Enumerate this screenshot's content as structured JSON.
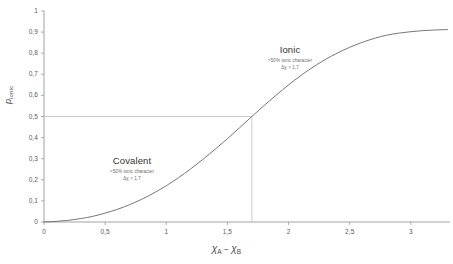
{
  "chart_data": {
    "type": "line",
    "title": "",
    "subtitle": "",
    "xlabel": "χA − χB",
    "ylabel": "pionic",
    "xlim": [
      0,
      3.32
    ],
    "ylim": [
      0,
      1
    ],
    "grid": false,
    "legend_position": "none",
    "xticks": [
      "0",
      "0,5",
      "1",
      "1,5",
      "2",
      "2,5",
      "3"
    ],
    "xtick_values": [
      0,
      0.5,
      1,
      1.5,
      2,
      2.5,
      3
    ],
    "yticks": [
      "0",
      "0,1",
      "0,2",
      "0,3",
      "0,4",
      "0,5",
      "0,6",
      "0,7",
      "0,8",
      "0,9",
      "1"
    ],
    "ytick_values": [
      0,
      0.1,
      0.2,
      0.3,
      0.4,
      0.5,
      0.6,
      0.7,
      0.8,
      0.9,
      1
    ],
    "series": [
      {
        "name": "ionic character",
        "color": "#666666",
        "x": [
          0,
          0.1,
          0.2,
          0.3,
          0.4,
          0.5,
          0.6,
          0.7,
          0.8,
          0.9,
          1.0,
          1.1,
          1.2,
          1.3,
          1.4,
          1.5,
          1.6,
          1.7,
          1.8,
          1.9,
          2.0,
          2.1,
          2.2,
          2.3,
          2.4,
          2.5,
          2.6,
          2.7,
          2.8,
          2.9,
          3.0,
          3.1,
          3.2,
          3.3
        ],
        "y": [
          0.0,
          0.003,
          0.008,
          0.016,
          0.027,
          0.042,
          0.06,
          0.082,
          0.108,
          0.138,
          0.172,
          0.21,
          0.252,
          0.297,
          0.345,
          0.395,
          0.447,
          0.5,
          0.552,
          0.602,
          0.65,
          0.694,
          0.734,
          0.77,
          0.801,
          0.828,
          0.851,
          0.87,
          0.885,
          0.895,
          0.902,
          0.907,
          0.91,
          0.912
        ]
      }
    ],
    "reference_lines": [
      {
        "name": "half-ionic-horizontal",
        "orientation": "horizontal",
        "value": 0.5,
        "label": "0,5"
      },
      {
        "name": "threshold-vertical",
        "orientation": "vertical",
        "value": 1.7,
        "label": "1,7"
      }
    ],
    "annotations": [
      {
        "name": "ionic-region",
        "heading": "Ionic",
        "line1": ">50% ionic character",
        "line2": "Δχ > 1,7",
        "x": 2.0,
        "y": 0.78
      },
      {
        "name": "covalent-region",
        "heading": "Covalent",
        "line1": "<50% ionic character",
        "line2": "Δχ < 1,7",
        "x": 0.9,
        "y": 0.28
      }
    ]
  },
  "axes": {
    "x_label_symbol_a": "χ",
    "x_label_sub_a": "A",
    "x_label_minus": "−",
    "x_label_symbol_b": "χ",
    "x_label_sub_b": "B",
    "y_label_symbol": "p",
    "y_label_sub": "ionic"
  },
  "colors": {
    "curve": "#666666",
    "axis": "#8c8c8c",
    "reference_line": "#b4b4b4",
    "text": "#4a4a4a",
    "background": "#ffffff"
  }
}
